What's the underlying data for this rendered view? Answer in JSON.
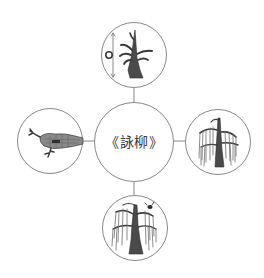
{
  "diagram": {
    "type": "mind-map",
    "center": {
      "label": "《詠柳》"
    },
    "nodes": [
      {
        "position": "top",
        "illustration": "willow-sapling-with-height-marker",
        "label": ""
      },
      {
        "position": "left",
        "illustration": "willow-branch-horizontal",
        "label": ""
      },
      {
        "position": "right",
        "illustration": "willow-tree-drooping",
        "label": ""
      },
      {
        "position": "bottom",
        "illustration": "willow-tree-full-with-bird",
        "label": ""
      }
    ],
    "colors": {
      "stroke": "#7a7a7a",
      "ink": "#3a3a3a",
      "background": "#ffffff"
    }
  }
}
